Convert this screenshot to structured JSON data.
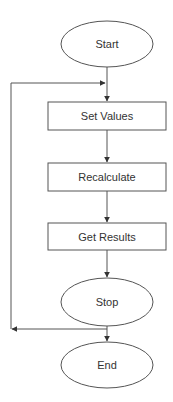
{
  "diagram": {
    "type": "flowchart",
    "nodes": [
      {
        "id": "start",
        "shape": "ellipse",
        "label": "Start"
      },
      {
        "id": "set_values",
        "shape": "rectangle",
        "label": "Set Values"
      },
      {
        "id": "recalculate",
        "shape": "rectangle",
        "label": "Recalculate"
      },
      {
        "id": "get_results",
        "shape": "rectangle",
        "label": "Get Results"
      },
      {
        "id": "stop",
        "shape": "ellipse",
        "label": "Stop"
      },
      {
        "id": "end",
        "shape": "ellipse",
        "label": "End"
      }
    ],
    "edges": [
      {
        "from": "start",
        "to": "set_values"
      },
      {
        "from": "set_values",
        "to": "recalculate"
      },
      {
        "from": "recalculate",
        "to": "get_results"
      },
      {
        "from": "get_results",
        "to": "stop"
      },
      {
        "from": "stop",
        "to": "end"
      },
      {
        "from": "stop",
        "to": "set_values",
        "type": "loop-back"
      }
    ],
    "colors": {
      "stroke": "#4a4a4a",
      "text": "#333333",
      "background": "#ffffff"
    }
  }
}
